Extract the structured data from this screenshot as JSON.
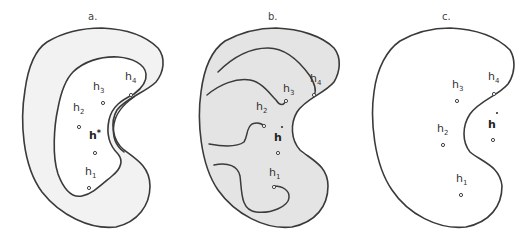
{
  "figure": {
    "panels": [
      {
        "id": "a",
        "label": "a.",
        "fill_outer": "#f2f2f2",
        "fill_inner": "#ffffff",
        "points": [
          {
            "name": "h",
            "sub": "3"
          },
          {
            "name": "h",
            "sub": "4"
          },
          {
            "name": "h",
            "sub": "2"
          },
          {
            "name": "h*",
            "sub": ""
          },
          {
            "name": "h",
            "sub": "1"
          }
        ]
      },
      {
        "id": "b",
        "label": "b.",
        "fill": "#e4e4e4",
        "points": [
          {
            "name": "h",
            "sub": "3"
          },
          {
            "name": "h",
            "sub": "4"
          },
          {
            "name": "h",
            "sub": "2"
          },
          {
            "name": "h*",
            "sub": ""
          },
          {
            "name": "h",
            "sub": "1"
          }
        ]
      },
      {
        "id": "c",
        "label": "c.",
        "fill": "#ffffff",
        "points": [
          {
            "name": "h",
            "sub": "3"
          },
          {
            "name": "h",
            "sub": "4"
          },
          {
            "name": "h",
            "sub": "2"
          },
          {
            "name": "h*",
            "sub": ""
          },
          {
            "name": "h",
            "sub": "1"
          }
        ]
      }
    ],
    "labels": {
      "h": "h",
      "s1": "1",
      "s2": "2",
      "s3": "3",
      "s4": "4",
      "star": "*"
    },
    "colors": {
      "stroke": "#3a3a3a",
      "panel_a_band": "#f2f2f2",
      "panel_b_fill": "#e4e4e4",
      "background": "#ffffff"
    }
  }
}
